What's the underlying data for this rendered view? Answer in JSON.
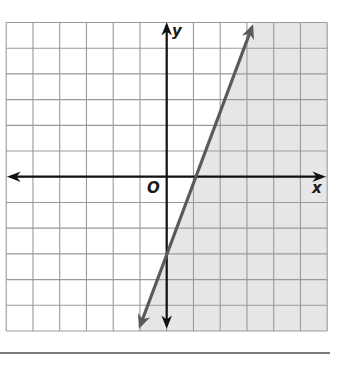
{
  "chart_data": {
    "type": "line",
    "title": "",
    "xlabel": "x",
    "ylabel": "y",
    "origin_label": "O",
    "xlim": [
      -6,
      6
    ],
    "ylim": [
      -6,
      6
    ],
    "grid": true,
    "grid_step": 1,
    "legend": null,
    "series": [
      {
        "name": "boundary line",
        "equation": "y = 3x - 3",
        "slope": 3,
        "y_intercept": -3,
        "x_intercept": 1,
        "style": "solid",
        "arrows": "both ends",
        "points": [
          [
            -1,
            -6
          ],
          [
            0,
            -3
          ],
          [
            1,
            0
          ],
          [
            2,
            3
          ],
          [
            3,
            6
          ]
        ]
      }
    ],
    "shaded_region": {
      "inequality": "y <= 3x - 3",
      "side": "right/below the line"
    },
    "colors": {
      "grid": "#9a9a9a",
      "axes": "#111111",
      "boundary_line": "#5a5a5a",
      "shading": "#e6e6e6",
      "rule": "#7a7a7a"
    }
  }
}
